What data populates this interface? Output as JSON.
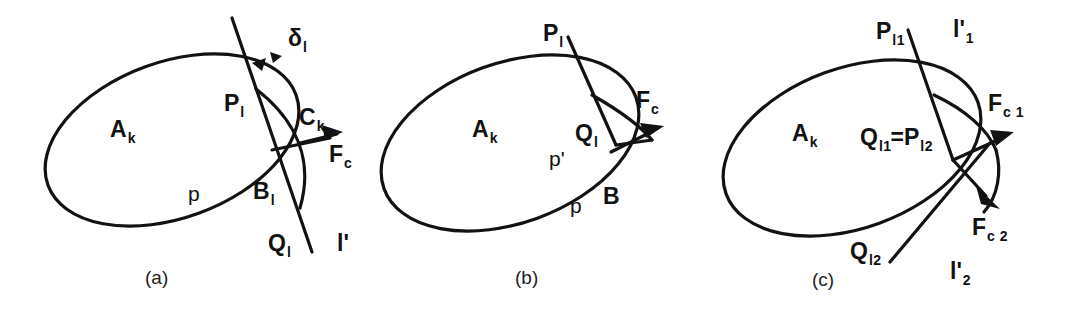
{
  "figure": {
    "stroke_color": "#121212",
    "background_color": "#ffffff",
    "panel_count": 3
  },
  "panels": [
    {
      "id": "a",
      "caption": "(a)",
      "labels": {
        "region": {
          "base": "A",
          "sub": "k"
        },
        "point_p": {
          "base": "P",
          "sub": "l"
        },
        "point_q": {
          "base": "Q",
          "sub": "l"
        },
        "point_b": {
          "base": "B",
          "sub": "l"
        },
        "point_c": {
          "base": "C",
          "sub": "k"
        },
        "force": {
          "base": "F",
          "sub": "c"
        },
        "delta": {
          "base": "δ",
          "sub": "l"
        },
        "path_p": "p",
        "line": "l'"
      }
    },
    {
      "id": "b",
      "caption": "(b)",
      "labels": {
        "region": {
          "base": "A",
          "sub": "k"
        },
        "point_p": {
          "base": "P",
          "sub": "l"
        },
        "point_q": {
          "base": "Q",
          "sub": "l"
        },
        "point_b": {
          "base": "B",
          "sub": ""
        },
        "force": {
          "base": "F",
          "sub": "c"
        },
        "path_p": "p",
        "path_p_prime": "p'"
      }
    },
    {
      "id": "c",
      "caption": "(c)",
      "labels": {
        "region": {
          "base": "A",
          "sub": "k"
        },
        "point_p1": {
          "base": "P",
          "sub": "l1"
        },
        "point_q2": {
          "base": "Q",
          "sub": "l2"
        },
        "equality": {
          "left_base": "Q",
          "left_sub": "l1",
          "operator": "=",
          "right_base": "P",
          "right_sub": "l2"
        },
        "force_1": {
          "base": "F",
          "sub": "c 1"
        },
        "force_2": {
          "base": "F",
          "sub": "c 2"
        },
        "line_1": {
          "base": "l'",
          "sub": "1"
        },
        "line_2": {
          "base": "l'",
          "sub": "2"
        }
      }
    }
  ]
}
